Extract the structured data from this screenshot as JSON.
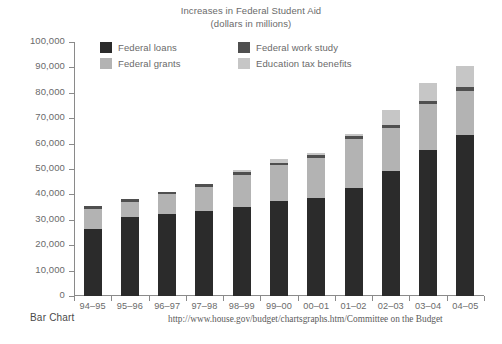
{
  "title": {
    "main": "Increases in Federal Student Aid",
    "sub": "(dollars in millions)"
  },
  "footer": {
    "chart_type_label": "Bar Chart",
    "source": "http://www.house.gov/budget/chartsgraphs.htm/Committee on the Budget"
  },
  "colors": {
    "federal_loans": "#2b2b2b",
    "federal_grants": "#b3b3b3",
    "federal_work_study": "#4f4f4f",
    "education_tax_benefits": "#c6c6c6",
    "axis": "#8a8a8a",
    "text": "#6a6a6a"
  },
  "chart_data": {
    "type": "bar",
    "stacked": true,
    "title": "Increases in Federal Student Aid",
    "subtitle": "(dollars in millions)",
    "xlabel": "",
    "ylabel": "",
    "ylim": [
      0,
      100000
    ],
    "ytick_interval": 10000,
    "yticks": [
      0,
      10000,
      20000,
      30000,
      40000,
      50000,
      60000,
      70000,
      80000,
      90000,
      100000
    ],
    "ytick_labels": [
      "0",
      "10,000",
      "20,000",
      "30,000",
      "40,000",
      "50,000",
      "60,000",
      "70,000",
      "80,000",
      "90,000",
      "100,000"
    ],
    "grid": false,
    "legend_position": "top-inside",
    "categories": [
      "94–95",
      "95–96",
      "96–97",
      "97–98",
      "98–99",
      "99–00",
      "00–01",
      "01–02",
      "02–03",
      "03–04",
      "04–05"
    ],
    "series": [
      {
        "name": "Federal loans",
        "color": "#2b2b2b",
        "values": [
          26300,
          31000,
          32100,
          33600,
          34900,
          37400,
          38700,
          42600,
          49400,
          57600,
          63200
        ]
      },
      {
        "name": "Federal grants",
        "color": "#b3b3b3",
        "values": [
          8000,
          6100,
          8100,
          9500,
          12800,
          14000,
          15800,
          19300,
          16800,
          17900,
          17700
        ]
      },
      {
        "name": "Federal work study",
        "color": "#4f4f4f",
        "values": [
          1000,
          1000,
          900,
          900,
          1000,
          1000,
          1100,
          1200,
          1100,
          1200,
          1300
        ]
      },
      {
        "name": "Education tax benefits",
        "color": "#c6c6c6",
        "values": [
          0,
          0,
          0,
          0,
          1000,
          1500,
          700,
          200,
          6000,
          7200,
          8300
        ]
      }
    ],
    "totals": [
      35300,
      38100,
      41100,
      44000,
      49700,
      53900,
      56300,
      63300,
      73300,
      83900,
      90500
    ]
  }
}
